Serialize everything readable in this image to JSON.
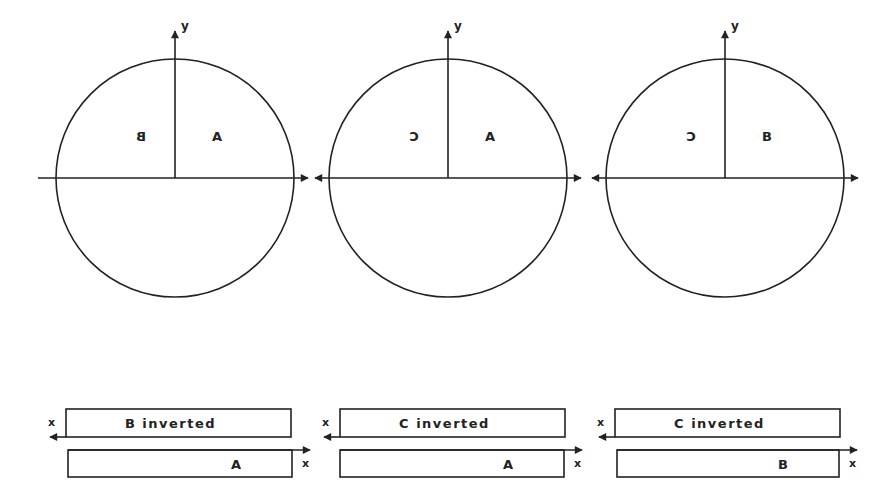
{
  "axis_labels": {
    "x": "x",
    "y": "y"
  },
  "circles": [
    {
      "cx": 175,
      "cy": 178,
      "r": 119,
      "left_label": "B",
      "left_mirrored": true,
      "right_label": "A",
      "left_arrow": false
    },
    {
      "cx": 448,
      "cy": 178,
      "r": 119,
      "left_label": "C",
      "left_mirrored": true,
      "right_label": "A",
      "left_arrow": true
    },
    {
      "cx": 725,
      "cy": 178,
      "r": 119,
      "left_label": "C",
      "left_mirrored": true,
      "right_label": "B",
      "left_arrow": true
    }
  ],
  "strips": [
    {
      "top_text": "B  inverted",
      "bottom_text": "A",
      "top_x": 66,
      "top_w": 225,
      "bot_x": 68,
      "bot_w": 224
    },
    {
      "top_text": "C  inverted",
      "bottom_text": "A",
      "top_x": 340,
      "top_w": 225,
      "bot_x": 340,
      "bot_w": 224
    },
    {
      "top_text": "C  inverted",
      "bottom_text": "B",
      "top_x": 615,
      "top_w": 225,
      "bot_x": 617,
      "bot_w": 222
    }
  ]
}
